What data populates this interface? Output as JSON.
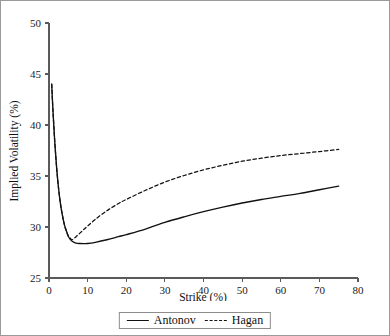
{
  "chart_data": {
    "type": "line",
    "title": "",
    "xlabel": "Strike (%)",
    "ylabel": "Implied Volatility (%)",
    "xlim": [
      0,
      80
    ],
    "ylim": [
      25,
      50
    ],
    "xticks": [
      0,
      10,
      20,
      30,
      40,
      50,
      60,
      70,
      80
    ],
    "yticks": [
      25,
      30,
      35,
      40,
      45,
      50
    ],
    "xtick_labels": [
      "0",
      "10",
      "20",
      "30",
      "40",
      "50",
      "60",
      "70",
      "80"
    ],
    "ytick_labels": [
      "25",
      "30",
      "35",
      "40",
      "45",
      "50"
    ],
    "grid": false,
    "legend_position": "below-axis-centered",
    "line_color": "#111111",
    "series": [
      {
        "name": "Antonov",
        "style": "solid",
        "x": [
          0.7,
          1.0,
          1.5,
          2.0,
          2.5,
          3.0,
          3.5,
          4.0,
          4.5,
          5.0,
          5.5,
          6.0,
          7.0,
          8.0,
          9.0,
          10.0,
          12.0,
          15.0,
          18.0,
          20.0,
          25.0,
          30.0,
          35.0,
          40.0,
          45.0,
          50.0,
          55.0,
          60.0,
          65.0,
          70.0,
          75.0
        ],
        "y": [
          44.0,
          41.6,
          38.3,
          35.7,
          33.7,
          32.2,
          31.1,
          30.2,
          29.6,
          29.1,
          28.8,
          28.6,
          28.42,
          28.38,
          28.37,
          28.38,
          28.5,
          28.75,
          29.05,
          29.25,
          29.8,
          30.45,
          31.0,
          31.5,
          31.95,
          32.35,
          32.7,
          33.0,
          33.3,
          33.65,
          34.0
        ]
      },
      {
        "name": "Hagan",
        "style": "dashed",
        "x": [
          0.7,
          1.0,
          1.5,
          2.0,
          2.5,
          3.0,
          3.5,
          4.0,
          4.5,
          5.0,
          5.5,
          6.0,
          7.0,
          8.0,
          9.0,
          10.0,
          12.0,
          15.0,
          18.0,
          20.0,
          25.0,
          30.0,
          35.0,
          40.0,
          45.0,
          50.0,
          55.0,
          60.0,
          65.0,
          70.0,
          75.0
        ],
        "y": [
          44.0,
          41.6,
          38.3,
          35.7,
          33.7,
          32.2,
          31.1,
          30.2,
          29.6,
          29.1,
          28.9,
          28.75,
          29.05,
          29.4,
          29.75,
          30.1,
          30.75,
          31.6,
          32.3,
          32.7,
          33.6,
          34.4,
          35.05,
          35.6,
          36.05,
          36.45,
          36.75,
          37.0,
          37.2,
          37.4,
          37.6
        ]
      }
    ]
  },
  "legend": {
    "entries": [
      {
        "label": "Antonov",
        "style": "solid"
      },
      {
        "label": "Hagan",
        "style": "dashed"
      }
    ]
  }
}
